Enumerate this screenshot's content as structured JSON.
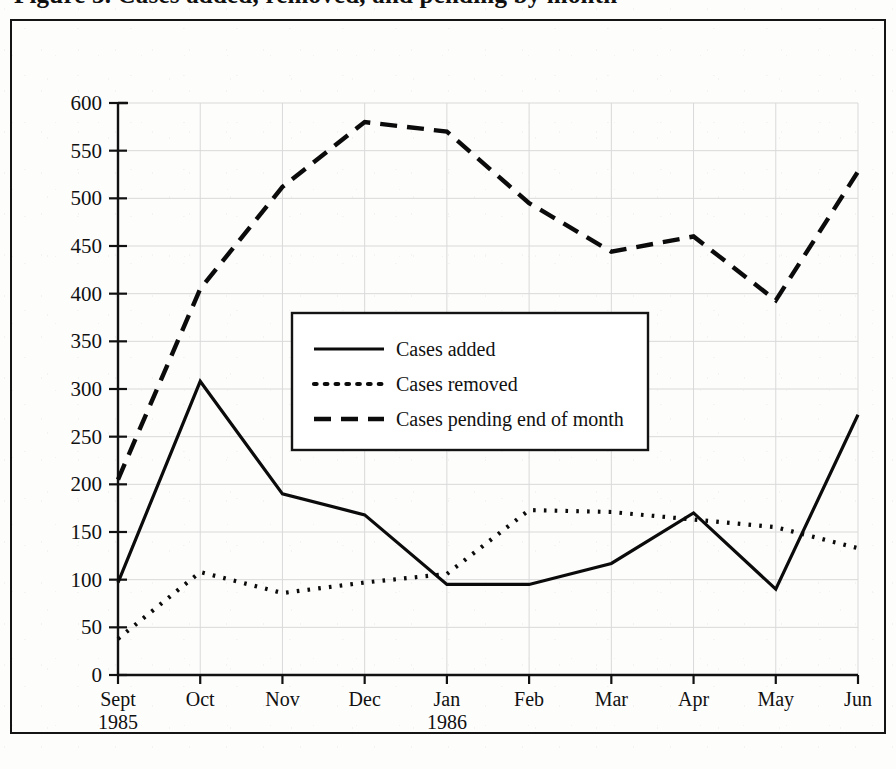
{
  "title": "Figure 3. Cases added, removed, and pending by month",
  "chart_data": {
    "type": "line",
    "title": "Figure 3. Cases added, removed, and pending by month",
    "xlabel": "",
    "ylabel": "",
    "ylim": [
      0,
      600
    ],
    "ytick_step": 50,
    "grid": true,
    "legend_position": "center-left-inside",
    "categories": [
      "Sept\n1985",
      "Oct",
      "Nov",
      "Dec",
      "Jan\n1986",
      "Feb",
      "Mar",
      "Apr",
      "May",
      "Jun"
    ],
    "x_tick_labels": [
      {
        "line1": "Sept",
        "line2": "1985"
      },
      {
        "line1": "Oct",
        "line2": ""
      },
      {
        "line1": "Nov",
        "line2": ""
      },
      {
        "line1": "Dec",
        "line2": ""
      },
      {
        "line1": "Jan",
        "line2": "1986"
      },
      {
        "line1": "Feb",
        "line2": ""
      },
      {
        "line1": "Mar",
        "line2": ""
      },
      {
        "line1": "Apr",
        "line2": ""
      },
      {
        "line1": "May",
        "line2": ""
      },
      {
        "line1": "Jun",
        "line2": ""
      }
    ],
    "y_tick_labels": [
      "600",
      "550",
      "500",
      "450",
      "400",
      "350",
      "300",
      "250",
      "200",
      "150",
      "100",
      "50",
      "0"
    ],
    "series": [
      {
        "name": "Cases added",
        "style": "solid",
        "color": "#0b0b0b",
        "values": [
          97,
          308,
          190,
          168,
          95,
          95,
          117,
          170,
          90,
          273
        ]
      },
      {
        "name": "Cases removed",
        "style": "dotted",
        "color": "#0b0b0b",
        "values": [
          38,
          108,
          86,
          97,
          106,
          173,
          171,
          163,
          155,
          133
        ]
      },
      {
        "name": "Cases pending end of month",
        "style": "dashed",
        "color": "#0b0b0b",
        "values": [
          205,
          405,
          512,
          580,
          570,
          495,
          444,
          460,
          393,
          528
        ]
      }
    ]
  },
  "legend": {
    "items": [
      {
        "label": "Cases added",
        "style": "solid"
      },
      {
        "label": "Cases removed",
        "style": "dotted"
      },
      {
        "label": "Cases pending end of month",
        "style": "dashed"
      }
    ]
  },
  "colors": {
    "ink": "#0b0b0b",
    "grid": "#d9d9d9",
    "paper": "#fdfdfc",
    "frame": "#141414"
  }
}
